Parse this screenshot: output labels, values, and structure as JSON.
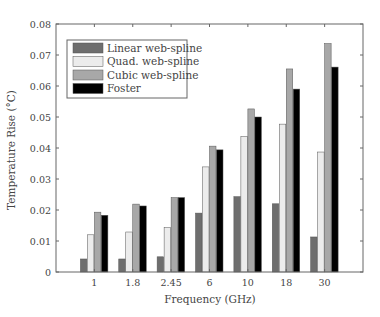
{
  "chart_data": {
    "type": "bar",
    "title": "",
    "xlabel": "Frequency (GHz)",
    "ylabel": "Temperature Rise (°C)",
    "ylim": [
      0,
      0.08
    ],
    "yticks": [
      "0",
      "0.01",
      "0.02",
      "0.03",
      "0.04",
      "0.05",
      "0.06",
      "0.07",
      "0.08"
    ],
    "categories": [
      "1",
      "1.8",
      "2.45",
      "6",
      "10",
      "18",
      "30"
    ],
    "grid": false,
    "legend_position": "upper left",
    "series": [
      {
        "name": "Linear web-spline",
        "color": "#6e6e6e",
        "values": [
          0.0042,
          0.0042,
          0.0049,
          0.019,
          0.0243,
          0.022,
          0.0113
        ]
      },
      {
        "name": "Quad. web-spline",
        "color": "#ececec",
        "values": [
          0.012,
          0.0129,
          0.0143,
          0.0339,
          0.0437,
          0.0477,
          0.0387
        ]
      },
      {
        "name": "Cubic web-spline",
        "color": "#a8a8a8",
        "values": [
          0.0193,
          0.0219,
          0.024,
          0.0406,
          0.0526,
          0.0655,
          0.0737
        ]
      },
      {
        "name": "Foster",
        "color": "#000000",
        "values": [
          0.0183,
          0.0213,
          0.024,
          0.0394,
          0.05,
          0.059,
          0.0661
        ]
      }
    ]
  }
}
